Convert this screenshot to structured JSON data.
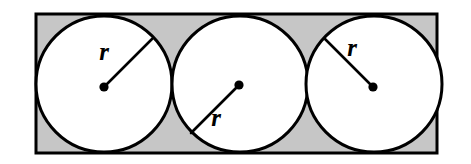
{
  "figure": {
    "name": "three-congruent-circles-inscribed-in-rectangle",
    "type": "geometry-diagram",
    "canvas": {
      "width": 471,
      "height": 164,
      "background": "#ffffff"
    },
    "colors": {
      "rectangle_fill": "#c6c6c6",
      "circle_fill": "#ffffff",
      "stroke": "#000000",
      "label_color": "#000000"
    },
    "rectangle": {
      "label": "rectangle",
      "x": 36,
      "y": 14,
      "width": 401,
      "height": 139,
      "stroke_width": 3
    },
    "circles": [
      {
        "label": "circle-1",
        "cx": 104,
        "cy": 84,
        "r": 68,
        "stroke_width": 3,
        "center_dot_r": 4.6,
        "center_dot_cx": 104,
        "center_dot_cy": 87,
        "radius_line": {
          "x1": 104,
          "y1": 87,
          "x2": 152,
          "y2": 39
        },
        "radius_label": {
          "text": "r",
          "x": 104,
          "y": 60
        }
      },
      {
        "label": "circle-2",
        "cx": 240,
        "cy": 84,
        "r": 68,
        "stroke_width": 3,
        "center_dot_r": 4.6,
        "center_dot_cx": 239,
        "center_dot_cy": 85,
        "radius_line": {
          "x1": 239,
          "y1": 85,
          "x2": 191,
          "y2": 133
        },
        "radius_label": {
          "text": "r",
          "x": 216,
          "y": 126
        }
      },
      {
        "label": "circle-3",
        "cx": 374,
        "cy": 84,
        "r": 68,
        "stroke_width": 3,
        "center_dot_r": 4.6,
        "center_dot_cx": 373,
        "center_dot_cy": 87,
        "radius_line": {
          "x1": 373,
          "y1": 87,
          "x2": 325,
          "y2": 39
        },
        "radius_label": {
          "text": "r",
          "x": 352,
          "y": 56
        }
      }
    ],
    "labels": {
      "radius_symbol": "r"
    }
  }
}
